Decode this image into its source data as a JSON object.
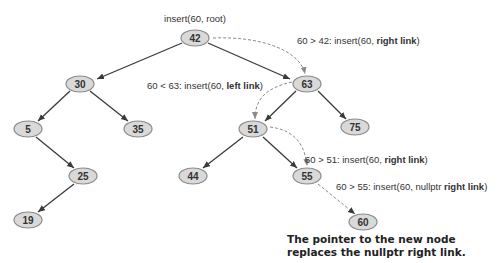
{
  "diagram": {
    "title": "insert(60, root)",
    "nodes": [
      {
        "id": "n42",
        "label": "42",
        "x": 195,
        "y": 38
      },
      {
        "id": "n30",
        "label": "30",
        "x": 80,
        "y": 84
      },
      {
        "id": "n63",
        "label": "63",
        "x": 307,
        "y": 84
      },
      {
        "id": "n5",
        "label": "5",
        "x": 28,
        "y": 129
      },
      {
        "id": "n35",
        "label": "35",
        "x": 138,
        "y": 129
      },
      {
        "id": "n51",
        "label": "51",
        "x": 253,
        "y": 129
      },
      {
        "id": "n75",
        "label": "75",
        "x": 355,
        "y": 127
      },
      {
        "id": "n25",
        "label": "25",
        "x": 83,
        "y": 176
      },
      {
        "id": "n44",
        "label": "44",
        "x": 193,
        "y": 176
      },
      {
        "id": "n55",
        "label": "55",
        "x": 307,
        "y": 176
      },
      {
        "id": "n19",
        "label": "19",
        "x": 28,
        "y": 220
      },
      {
        "id": "n60",
        "label": "60",
        "x": 363,
        "y": 222
      }
    ],
    "annotations": [
      {
        "prefix": "60 > 42: insert(60, ",
        "bold": "right link",
        "suffix": ")"
      },
      {
        "prefix": "60 < 63: insert(60, ",
        "bold": "left link",
        "suffix": ")"
      },
      {
        "prefix": "60 > 51: insert(60, ",
        "bold": "right link",
        "suffix": ")"
      },
      {
        "prefix": "60 > 55: insert(60, nullptr ",
        "bold": "right link",
        "suffix": ")"
      }
    ],
    "caption_line1": "The pointer to the new node",
    "caption_line2": "replaces the nullptr right link."
  }
}
